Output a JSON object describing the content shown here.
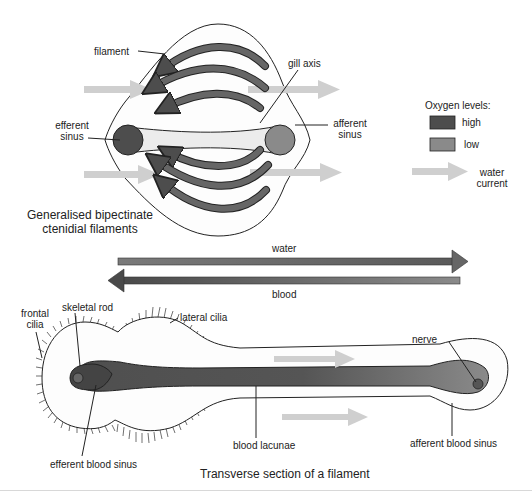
{
  "colors": {
    "oxygen_high": "#4d4d4d",
    "oxygen_low": "#8a8a8a",
    "water_current": "#cfcfcf",
    "gill_axis_fill": "#ececec",
    "outline": "#222222"
  },
  "top_diagram": {
    "caption_line1": "Generalised bipectinate",
    "caption_line2": "ctenidial filaments",
    "labels": {
      "filament": "filament",
      "gill_axis": "gill axis",
      "efferent_sinus_1": "efferent",
      "efferent_sinus_2": "sinus",
      "afferent_sinus_1": "afferent",
      "afferent_sinus_2": "sinus"
    }
  },
  "legend": {
    "title": "Oxygen levels:",
    "items": [
      {
        "label": "high",
        "color": "#4d4d4d"
      },
      {
        "label": "low",
        "color": "#8a8a8a"
      }
    ],
    "water_current_1": "water",
    "water_current_2": "current"
  },
  "countercurrent": {
    "water_label": "water",
    "blood_label": "blood"
  },
  "bottom_diagram": {
    "caption": "Transverse section of a filament",
    "labels": {
      "frontal_cilia_1": "frontal",
      "frontal_cilia_2": "cilia",
      "skeletal_rod": "skeletal rod",
      "lateral_cilia": "lateral cilia",
      "nerve": "nerve",
      "blood_lacunae": "blood lacunae",
      "efferent_blood_sinus": "efferent blood sinus",
      "afferent_blood_sinus": "afferent blood sinus"
    }
  }
}
